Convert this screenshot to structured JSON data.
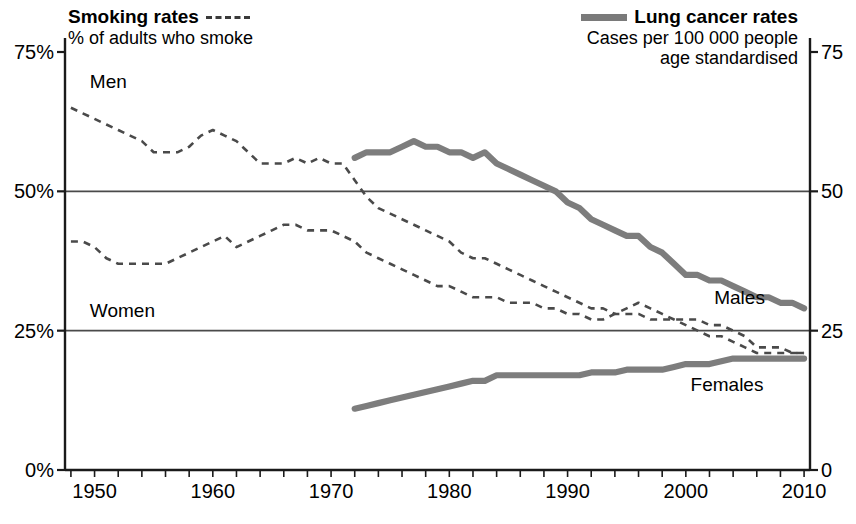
{
  "legend": {
    "left": {
      "title": "Smoking rates",
      "subtitle": "% of adults who smoke",
      "swatch": "dashed-line-swatch"
    },
    "right": {
      "title": "Lung cancer rates",
      "subtitle_line1": "Cases per 100 000 people",
      "subtitle_line2": "age standardised",
      "swatch": "thick-solid-line-swatch"
    }
  },
  "series_labels": {
    "men": "Men",
    "women": "Women",
    "males": "Males",
    "females": "Females"
  },
  "colors": {
    "smoking_line": "#4a4a4a",
    "cancer_line": "#7d7d7d",
    "axis": "#1a1a1a",
    "grid": "#4a4a4a",
    "background": "#ffffff"
  },
  "chart_data": {
    "type": "line",
    "title": "",
    "xlabel": "",
    "ylabel_left": "% of adults who smoke",
    "ylabel_right": "Cases per 100 000 people, age standardised",
    "xlim": [
      1947.5,
      2010.5
    ],
    "ylim_left": [
      0,
      75
    ],
    "ylim_right": [
      0,
      75
    ],
    "left_ticks": [
      "0%",
      "25%",
      "50%",
      "75%"
    ],
    "left_tick_values": [
      0,
      25,
      50,
      75
    ],
    "right_ticks": [
      "0",
      "25",
      "50",
      "75"
    ],
    "right_tick_values": [
      0,
      25,
      50,
      75
    ],
    "xticks": [
      1950,
      1960,
      1970,
      1980,
      1990,
      2000,
      2010
    ],
    "xtick_labels": [
      "1950",
      "1960",
      "1970",
      "1980",
      "1990",
      "2000",
      "2010"
    ],
    "minor_tick_interval": 2,
    "grid": "horizontal-at-25-and-50",
    "legend_position": "top",
    "series": [
      {
        "name": "Men",
        "axis": "left",
        "style": "dashed",
        "unit": "% of adults who smoke",
        "x": [
          1948,
          1949,
          1950,
          1951,
          1952,
          1953,
          1954,
          1955,
          1956,
          1957,
          1958,
          1959,
          1960,
          1961,
          1962,
          1963,
          1964,
          1965,
          1966,
          1967,
          1968,
          1969,
          1970,
          1971,
          1972,
          1973,
          1974,
          1975,
          1976,
          1977,
          1978,
          1979,
          1980,
          1981,
          1982,
          1983,
          1984,
          1985,
          1986,
          1987,
          1988,
          1989,
          1990,
          1991,
          1992,
          1993,
          1994,
          1995,
          1996,
          1997,
          1998,
          1999,
          2000,
          2001,
          2002,
          2003,
          2004,
          2005,
          2006,
          2007,
          2008,
          2009,
          2010
        ],
        "values": [
          65,
          64,
          63,
          62,
          61,
          60,
          59,
          57,
          57,
          57,
          58,
          60,
          61,
          60,
          59,
          57,
          55,
          55,
          55,
          56,
          55,
          56,
          55,
          55,
          52,
          49,
          47,
          46,
          45,
          44,
          43,
          42,
          41,
          39,
          38,
          38,
          37,
          36,
          35,
          34,
          33,
          32,
          31,
          30,
          29,
          29,
          28,
          28,
          28,
          27,
          27,
          27,
          27,
          27,
          26,
          26,
          25,
          24,
          22,
          22,
          22,
          21,
          21
        ]
      },
      {
        "name": "Women",
        "axis": "left",
        "style": "dashed",
        "unit": "% of adults who smoke",
        "x": [
          1948,
          1949,
          1950,
          1951,
          1952,
          1953,
          1954,
          1955,
          1956,
          1957,
          1958,
          1959,
          1960,
          1961,
          1962,
          1963,
          1964,
          1965,
          1966,
          1967,
          1968,
          1969,
          1970,
          1971,
          1972,
          1973,
          1974,
          1975,
          1976,
          1977,
          1978,
          1979,
          1980,
          1981,
          1982,
          1983,
          1984,
          1985,
          1986,
          1987,
          1988,
          1989,
          1990,
          1991,
          1992,
          1993,
          1994,
          1995,
          1996,
          1997,
          1998,
          1999,
          2000,
          2001,
          2002,
          2003,
          2004,
          2005,
          2006,
          2007,
          2008,
          2009,
          2010
        ],
        "values": [
          41,
          41,
          40,
          38,
          37,
          37,
          37,
          37,
          37,
          38,
          39,
          40,
          41,
          42,
          40,
          41,
          42,
          43,
          44,
          44,
          43,
          43,
          43,
          42,
          41,
          39,
          38,
          37,
          36,
          35,
          34,
          33,
          33,
          32,
          31,
          31,
          31,
          30,
          30,
          30,
          29,
          29,
          28,
          28,
          27,
          27,
          28,
          29,
          30,
          29,
          28,
          27,
          26,
          25,
          24,
          24,
          23,
          22,
          21,
          21,
          21,
          21,
          21
        ]
      },
      {
        "name": "Males",
        "axis": "right",
        "style": "solid-thick",
        "unit": "cases per 100 000",
        "x": [
          1972,
          1973,
          1974,
          1975,
          1976,
          1977,
          1978,
          1979,
          1980,
          1981,
          1982,
          1983,
          1984,
          1985,
          1986,
          1987,
          1988,
          1989,
          1990,
          1991,
          1992,
          1993,
          1994,
          1995,
          1996,
          1997,
          1998,
          1999,
          2000,
          2001,
          2002,
          2003,
          2004,
          2005,
          2006,
          2007,
          2008,
          2009,
          2010
        ],
        "values": [
          56,
          57,
          57,
          57,
          58,
          59,
          58,
          58,
          57,
          57,
          56,
          57,
          55,
          54,
          53,
          52,
          51,
          50,
          48,
          47,
          45,
          44,
          43,
          42,
          42,
          40,
          39,
          37,
          35,
          35,
          34,
          34,
          33,
          32,
          31,
          31,
          30,
          30,
          29
        ]
      },
      {
        "name": "Females",
        "axis": "right",
        "style": "solid-thick",
        "unit": "cases per 100 000",
        "x": [
          1972,
          1973,
          1974,
          1975,
          1976,
          1977,
          1978,
          1979,
          1980,
          1981,
          1982,
          1983,
          1984,
          1985,
          1986,
          1987,
          1988,
          1989,
          1990,
          1991,
          1992,
          1993,
          1994,
          1995,
          1996,
          1997,
          1998,
          1999,
          2000,
          2001,
          2002,
          2003,
          2004,
          2005,
          2006,
          2007,
          2008,
          2009,
          2010
        ],
        "values": [
          11,
          11.5,
          12,
          12.5,
          13,
          13.5,
          14,
          14.5,
          15,
          15.5,
          16,
          16,
          17,
          17,
          17,
          17,
          17,
          17,
          17,
          17,
          17.5,
          17.5,
          17.5,
          18,
          18,
          18,
          18,
          18.5,
          19,
          19,
          19,
          19.5,
          20,
          20,
          20,
          20,
          20,
          20,
          20
        ]
      }
    ]
  }
}
